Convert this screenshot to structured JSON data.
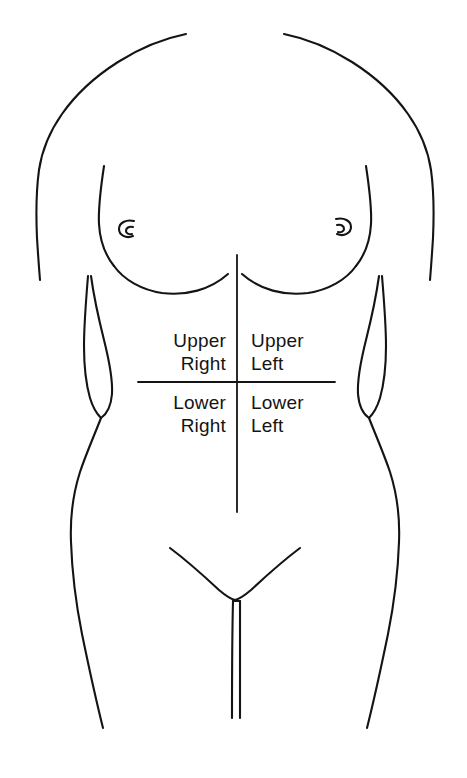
{
  "diagram": {
    "background_color": "#ffffff",
    "line_color": "#141414"
  },
  "quadrants": {
    "upper_right": "Upper\nRight",
    "upper_left": "Upper\nLeft",
    "lower_right": "Lower\nRight",
    "lower_left": "Lower\nLeft"
  },
  "anatomy": {
    "left_nipple": "left-nipple-mark",
    "right_nipple": "right-nipple-mark",
    "torso": "torso-outline",
    "left_arm": "left-arm-outline",
    "right_arm": "right-arm-outline",
    "groin": "groin-outline"
  },
  "axes": {
    "vertical_midline": "vertical-midline",
    "horizontal_line": "horizontal-umbilical-line"
  }
}
